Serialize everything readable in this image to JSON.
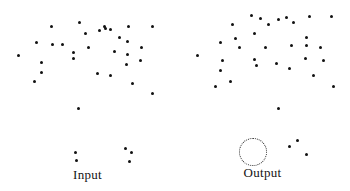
{
  "figure": {
    "width": 350,
    "height": 191,
    "background": "#ffffff",
    "dot_color": "#111111",
    "annotation_color": "#2a2a2a"
  },
  "panels": {
    "input": {
      "label": "Input"
    },
    "output": {
      "label": "Output"
    }
  },
  "chart_data": {
    "type": "scatter",
    "title": "",
    "xlabel": "",
    "ylabel": "",
    "grid": false,
    "legend": "none",
    "axes_visible": false,
    "tick_labels": [],
    "xlim": [
      0,
      175
    ],
    "ylim": [
      0,
      170
    ],
    "marker": {
      "shape": "circle",
      "size_px": 3,
      "color": "#111111"
    },
    "series": [
      {
        "name": "Input",
        "panel": "input",
        "n_points": 36,
        "points": [
          [
            51,
            26
          ],
          [
            79,
            22
          ],
          [
            104,
            26
          ],
          [
            110,
            29
          ],
          [
            128,
            26
          ],
          [
            152,
            26
          ],
          [
            36,
            42
          ],
          [
            52,
            44
          ],
          [
            85,
            33
          ],
          [
            99,
            30
          ],
          [
            105,
            28
          ],
          [
            127,
            41
          ],
          [
            41,
            62
          ],
          [
            41,
            72
          ],
          [
            73,
            52
          ],
          [
            73,
            58
          ],
          [
            114,
            51
          ],
          [
            127,
            54
          ],
          [
            34,
            81
          ],
          [
            126,
            64
          ],
          [
            97,
            73
          ],
          [
            110,
            75
          ],
          [
            132,
            83
          ],
          [
            152,
            93
          ],
          [
            78,
            108
          ],
          [
            75,
            152
          ],
          [
            76,
            160
          ],
          [
            125,
            148
          ],
          [
            131,
            152
          ],
          [
            129,
            161
          ],
          [
            18,
            55
          ],
          [
            62,
            44
          ],
          [
            88,
            47
          ],
          [
            119,
            37
          ],
          [
            141,
            47
          ],
          [
            140,
            60
          ]
        ]
      },
      {
        "name": "Output",
        "panel": "output",
        "n_points": 35,
        "points": [
          [
            57,
            24
          ],
          [
            45,
            42
          ],
          [
            60,
            38
          ],
          [
            79,
            33
          ],
          [
            85,
            18
          ],
          [
            93,
            24
          ],
          [
            103,
            19
          ],
          [
            111,
            17
          ],
          [
            118,
            22
          ],
          [
            134,
            16
          ],
          [
            156,
            16
          ],
          [
            76,
            15
          ],
          [
            47,
            60
          ],
          [
            45,
            70
          ],
          [
            79,
            59
          ],
          [
            81,
            65
          ],
          [
            131,
            37
          ],
          [
            131,
            45
          ],
          [
            116,
            45
          ],
          [
            55,
            81
          ],
          [
            40,
            86
          ],
          [
            130,
            58
          ],
          [
            101,
            63
          ],
          [
            114,
            68
          ],
          [
            138,
            75
          ],
          [
            158,
            86
          ],
          [
            103,
            108
          ],
          [
            122,
            140
          ],
          [
            114,
            146
          ],
          [
            131,
            154
          ],
          [
            22,
            55
          ],
          [
            64,
            47
          ],
          [
            90,
            47
          ],
          [
            145,
            47
          ],
          [
            148,
            60
          ]
        ]
      }
    ],
    "annotations": [
      {
        "kind": "dotted-circle",
        "panel": "output",
        "center": [
          78,
          152
        ],
        "radius_px": 14,
        "encircled_points": [
          [
            77,
            148
          ],
          [
            79,
            156
          ]
        ],
        "meaning": "merged-pair-highlight"
      }
    ]
  }
}
